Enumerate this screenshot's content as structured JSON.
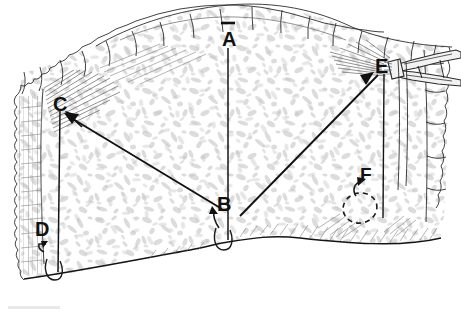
{
  "figure": {
    "kind": "surgical-anatomical-line-drawing",
    "title": "",
    "caption": "",
    "background_color": "#ffffff",
    "ink_color": "#1a1a1a",
    "tissue_fill_color": "#c9c9c9",
    "width_px": 461,
    "height_px": 314
  },
  "labels": [
    {
      "id": "A",
      "text": "A",
      "x": 228,
      "y": 40,
      "marker": "tick-above-and-vertical-line-below",
      "description": "midline vertical reference line descending from superior border"
    },
    {
      "id": "C",
      "text": "C",
      "x": 60,
      "y": 104,
      "marker": "arrow-pointing-up-left",
      "description": "left landmark with pointer arrow from B"
    },
    {
      "id": "E",
      "text": "E",
      "x": 381,
      "y": 66,
      "marker": "arrow-pointing-up-right",
      "description": "right landmark grasped by instrument, pointer arrow from B"
    },
    {
      "id": "B",
      "text": "B",
      "x": 224,
      "y": 204,
      "marker": "small-curved-arrow-up-left",
      "description": "central inferior origin point of both pointer arrows"
    },
    {
      "id": "D",
      "text": "D",
      "x": 42,
      "y": 229,
      "marker": "small-hooked-arrow",
      "description": "left lateral strip region"
    },
    {
      "id": "F",
      "text": "F",
      "x": 366,
      "y": 174,
      "marker": "curved-arrow-to-dashed-oval",
      "description": "right inferior region outlined by dashed oval"
    }
  ],
  "annotations": {
    "pointer_arrows": [
      {
        "name": "arrow-b-to-c",
        "from": [
          222,
          209
        ],
        "to": [
          64,
          113
        ]
      },
      {
        "name": "arrow-b-to-e",
        "from": [
          240,
          216
        ],
        "to": [
          374,
          72
        ]
      }
    ],
    "reference_lines": [
      {
        "name": "line-a-vertical",
        "from": [
          228,
          48
        ],
        "to": [
          228,
          241
        ]
      },
      {
        "name": "line-c-vertical",
        "from": [
          60,
          110
        ],
        "to": [
          60,
          274
        ]
      },
      {
        "name": "line-e-vertical",
        "from": [
          384,
          72
        ],
        "to": [
          384,
          218
        ]
      }
    ],
    "tick_marks": [
      {
        "name": "tick-above-a",
        "x": 228,
        "y": 23
      }
    ],
    "hook_loops": [
      {
        "name": "hook-loop-a",
        "cx": 224,
        "cy": 241
      },
      {
        "name": "hook-loop-c",
        "cx": 55,
        "cy": 272
      }
    ],
    "dashed_region": {
      "name": "dashed-oval-f",
      "cx": 362,
      "cy": 208,
      "rx": 16,
      "ry": 14
    }
  },
  "instrument": {
    "name": "surgical-forceps",
    "entry_side": "right",
    "tip_x": 392,
    "tip_y": 68,
    "label": "forceps"
  },
  "specimen": {
    "name": "tissue-specimen",
    "border_style": "scalloped-irregular",
    "texture": "mottled-stipple"
  }
}
